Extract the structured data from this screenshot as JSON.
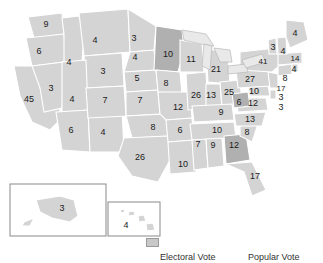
{
  "page": {
    "background": "#ffffff"
  },
  "palette": {
    "state_fill_light": "#d4d4d4",
    "state_fill_dark": "#b0b0b0",
    "state_stroke": "#ffffff",
    "great_lakes": "#e9e9e9",
    "inset_border": "#8a8a8a",
    "label_color": "#1a1a1a"
  },
  "footer": {
    "electoral_vote_label": "Electoral Vote",
    "popular_vote_label": "Popular Vote"
  },
  "insets": {
    "alaska": {
      "code": "AK",
      "votes": "3"
    },
    "hawaii": {
      "code": "HI",
      "votes": "4"
    }
  },
  "chart_data": {
    "type": "map",
    "title": "Electoral Vote",
    "value_key": "electoral_votes",
    "categories": [
      "WA",
      "OR",
      "CA",
      "NV",
      "ID",
      "MT",
      "WY",
      "UT",
      "AZ",
      "NM",
      "CO",
      "ND",
      "SD",
      "NE",
      "KS",
      "OK",
      "TX",
      "MN",
      "IA",
      "MO",
      "AR",
      "LA",
      "WI",
      "IL",
      "MI",
      "IN",
      "OH",
      "KY",
      "TN",
      "MS",
      "AL",
      "GA",
      "FL",
      "SC",
      "NC",
      "VA",
      "WV",
      "MD",
      "DE",
      "DC",
      "PA",
      "NJ",
      "NY",
      "CT",
      "RI",
      "MA",
      "VT",
      "NH",
      "ME",
      "AK",
      "HI"
    ],
    "values": [
      9,
      6,
      45,
      3,
      4,
      4,
      3,
      4,
      6,
      4,
      7,
      3,
      4,
      5,
      7,
      8,
      26,
      10,
      7,
      12,
      6,
      10,
      11,
      26,
      21,
      13,
      25,
      9,
      10,
      7,
      9,
      12,
      17,
      8,
      13,
      12,
      6,
      10,
      3,
      3,
      27,
      17,
      41,
      8,
      4,
      14,
      3,
      4,
      4,
      3,
      4
    ],
    "highlighted": [
      "MN",
      "WV",
      "GA"
    ],
    "legend": [
      "Electoral Vote",
      "Popular Vote"
    ],
    "states": [
      {
        "code": "WA",
        "votes": "9",
        "x": 46,
        "y": 25,
        "hl": false
      },
      {
        "code": "OR",
        "votes": "6",
        "x": 39,
        "y": 52,
        "hl": false
      },
      {
        "code": "CA",
        "votes": "45",
        "x": 29,
        "y": 100,
        "hl": false
      },
      {
        "code": "NV",
        "votes": "3",
        "x": 51,
        "y": 89,
        "hl": false
      },
      {
        "code": "ID",
        "votes": "4",
        "x": 69,
        "y": 63,
        "hl": false
      },
      {
        "code": "MT",
        "votes": "4",
        "x": 95,
        "y": 41,
        "hl": false
      },
      {
        "code": "WY",
        "votes": "3",
        "x": 103,
        "y": 72,
        "hl": false
      },
      {
        "code": "UT",
        "votes": "4",
        "x": 72,
        "y": 100,
        "hl": false
      },
      {
        "code": "AZ",
        "votes": "6",
        "x": 71,
        "y": 131,
        "hl": false
      },
      {
        "code": "NM",
        "votes": "4",
        "x": 103,
        "y": 133,
        "hl": false
      },
      {
        "code": "CO",
        "votes": "7",
        "x": 105,
        "y": 101,
        "hl": false
      },
      {
        "code": "ND",
        "votes": "3",
        "x": 134,
        "y": 39,
        "hl": false
      },
      {
        "code": "SD",
        "votes": "4",
        "x": 135,
        "y": 58,
        "hl": false
      },
      {
        "code": "NE",
        "votes": "5",
        "x": 137,
        "y": 79,
        "hl": false
      },
      {
        "code": "KS",
        "votes": "7",
        "x": 140,
        "y": 101,
        "hl": false
      },
      {
        "code": "OK",
        "votes": "8",
        "x": 153,
        "y": 128,
        "hl": false
      },
      {
        "code": "TX",
        "votes": "26",
        "x": 140,
        "y": 158,
        "hl": false
      },
      {
        "code": "MN",
        "votes": "10",
        "x": 168,
        "y": 55,
        "hl": true
      },
      {
        "code": "IA",
        "votes": "8",
        "x": 166,
        "y": 84,
        "hl": false
      },
      {
        "code": "MO",
        "votes": "12",
        "x": 178,
        "y": 108,
        "hl": false
      },
      {
        "code": "AR",
        "votes": "6",
        "x": 180,
        "y": 131,
        "hl": false
      },
      {
        "code": "LA",
        "votes": "10",
        "x": 183,
        "y": 165,
        "hl": false
      },
      {
        "code": "WI",
        "votes": "11",
        "x": 191,
        "y": 60,
        "hl": false
      },
      {
        "code": "IL",
        "votes": "26",
        "x": 196,
        "y": 96,
        "hl": false
      },
      {
        "code": "MI",
        "votes": "21",
        "x": 216,
        "y": 70,
        "hl": false
      },
      {
        "code": "IN",
        "votes": "13",
        "x": 211,
        "y": 96,
        "hl": false
      },
      {
        "code": "OH",
        "votes": "25",
        "x": 229,
        "y": 93,
        "hl": false
      },
      {
        "code": "KY",
        "votes": "9",
        "x": 221,
        "y": 113,
        "hl": false
      },
      {
        "code": "TN",
        "votes": "10",
        "x": 217,
        "y": 131,
        "hl": false
      },
      {
        "code": "MS",
        "votes": "7",
        "x": 198,
        "y": 145,
        "hl": false
      },
      {
        "code": "AL",
        "votes": "9",
        "x": 213,
        "y": 146,
        "hl": false
      },
      {
        "code": "GA",
        "votes": "12",
        "x": 234,
        "y": 146,
        "hl": true
      },
      {
        "code": "FL",
        "votes": "17",
        "x": 255,
        "y": 177,
        "hl": false
      },
      {
        "code": "SC",
        "votes": "8",
        "x": 247,
        "y": 133,
        "hl": false
      },
      {
        "code": "NC",
        "votes": "13",
        "x": 250,
        "y": 120,
        "hl": false
      },
      {
        "code": "VA",
        "votes": "12",
        "x": 253,
        "y": 104,
        "hl": false
      },
      {
        "code": "WV",
        "votes": "6",
        "x": 239,
        "y": 103,
        "hl": true
      },
      {
        "code": "MD",
        "votes": "10",
        "x": 254,
        "y": 92,
        "hl": false
      },
      {
        "code": "DE",
        "votes": "3",
        "x": 281,
        "y": 98,
        "hl": false
      },
      {
        "code": "DC",
        "votes": "3",
        "x": 281,
        "y": 108,
        "hl": false
      },
      {
        "code": "PA",
        "votes": "27",
        "x": 250,
        "y": 80,
        "hl": false
      },
      {
        "code": "NJ",
        "votes": "17",
        "x": 281,
        "y": 89,
        "hl": false
      },
      {
        "code": "NY",
        "votes": "41",
        "x": 263,
        "y": 62,
        "hl": false
      },
      {
        "code": "CT",
        "votes": "8",
        "x": 285,
        "y": 79,
        "hl": false
      },
      {
        "code": "RI",
        "votes": "4",
        "x": 294,
        "y": 70,
        "hl": false
      },
      {
        "code": "MA",
        "votes": "14",
        "x": 295,
        "y": 59,
        "hl": false
      },
      {
        "code": "VT",
        "votes": "3",
        "x": 273,
        "y": 48,
        "hl": false
      },
      {
        "code": "NH",
        "votes": "4",
        "x": 283,
        "y": 52,
        "hl": false
      },
      {
        "code": "ME",
        "votes": "4",
        "x": 295,
        "y": 34,
        "hl": false
      }
    ]
  }
}
